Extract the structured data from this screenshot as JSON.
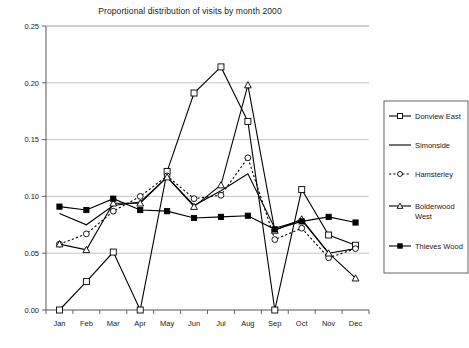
{
  "chart_data": {
    "type": "line",
    "title": "Proportional distribution of visits by month 2000",
    "xlabel": "",
    "ylabel": "",
    "grid": true,
    "legend_position": "right",
    "ylim": [
      0.0,
      0.25
    ],
    "yticks": [
      "0.00",
      "0.05",
      "0.10",
      "0.15",
      "0.20",
      "0.25"
    ],
    "ytick_values": [
      0.0,
      0.05,
      0.1,
      0.15,
      0.2,
      0.25
    ],
    "categories": [
      "Jan",
      "Feb",
      "Mar",
      "Apr",
      "May",
      "Jun",
      "Jul",
      "Aug",
      "Sep",
      "Oct",
      "Nov",
      "Dec"
    ],
    "series": [
      {
        "name": "Donview East",
        "marker": "open-square",
        "line": "solid",
        "values": [
          0.0,
          0.025,
          0.051,
          0.0,
          0.122,
          0.191,
          0.214,
          0.166,
          0.0,
          0.106,
          0.066,
          0.057
        ]
      },
      {
        "name": "Simonside",
        "marker": "none",
        "line": "solid",
        "values": [
          0.085,
          0.075,
          0.092,
          0.095,
          0.117,
          0.092,
          0.105,
          0.12,
          0.072,
          0.079,
          0.05,
          0.054
        ]
      },
      {
        "name": "Hamsterley",
        "marker": "open-circle",
        "line": "dotted",
        "values": [
          0.058,
          0.067,
          0.087,
          0.1,
          0.118,
          0.098,
          0.101,
          0.134,
          0.062,
          0.072,
          0.046,
          0.054
        ]
      },
      {
        "name": "Bolderwood West",
        "marker": "open-triangle",
        "line": "solid",
        "values": [
          0.058,
          0.053,
          0.094,
          0.094,
          0.117,
          0.091,
          0.11,
          0.198,
          0.07,
          0.08,
          0.05,
          0.028
        ]
      },
      {
        "name": "Thieves Wood",
        "marker": "filled-square",
        "line": "solid",
        "values": [
          0.091,
          0.088,
          0.098,
          0.088,
          0.087,
          0.081,
          0.082,
          0.083,
          0.071,
          0.078,
          0.082,
          0.077
        ]
      }
    ]
  },
  "legend": {
    "items": [
      {
        "label": "Donview East"
      },
      {
        "label": "Simonside"
      },
      {
        "label": "Hamsterley"
      },
      {
        "label": "Bolderwood West"
      },
      {
        "label": "Thieves Wood"
      }
    ]
  },
  "colors": {
    "line": "#000000",
    "grid": "#b8b8b8",
    "axis": "#555555",
    "text": "#222222",
    "background": "#ffffff"
  }
}
